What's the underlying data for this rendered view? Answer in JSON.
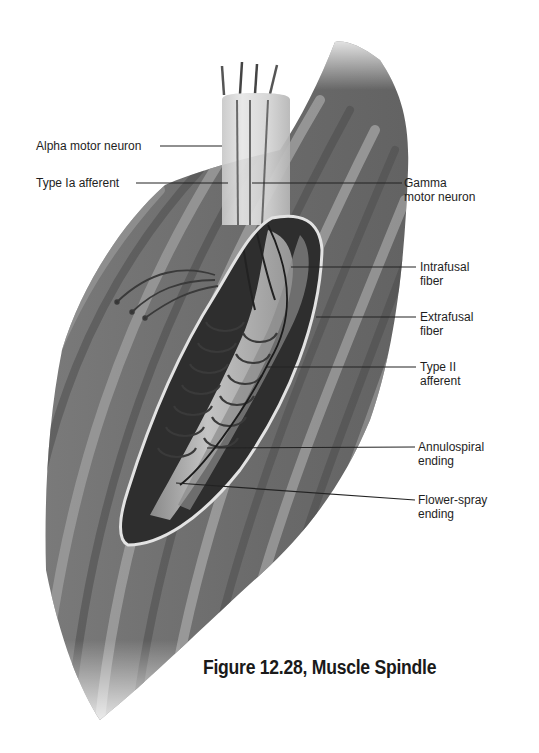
{
  "figure": {
    "caption": "Figure 12.28, Muscle Spindle"
  },
  "labels": {
    "alpha_motor_neuron": "Alpha motor neuron",
    "type_ia_afferent": "Type Ia afferent",
    "gamma_motor_neuron": [
      "Gamma",
      "motor neuron"
    ],
    "intrafusal_fiber": [
      "Intrafusal",
      "fiber"
    ],
    "extrafusal_fiber": [
      "Extrafusal",
      "fiber"
    ],
    "type_ii_afferent": [
      "Type II",
      "afferent"
    ],
    "annulospiral_ending": [
      "Annulospiral",
      "ending"
    ],
    "flower_spray_ending": [
      "Flower-spray",
      "ending"
    ]
  },
  "colors": {
    "background": "#ffffff",
    "muscle_dark": "#5a5a5a",
    "muscle_light": "#9a9a9a",
    "capsule_outline": "#e0e0e0",
    "leader_line": "#222222",
    "text": "#1e1e1e"
  }
}
